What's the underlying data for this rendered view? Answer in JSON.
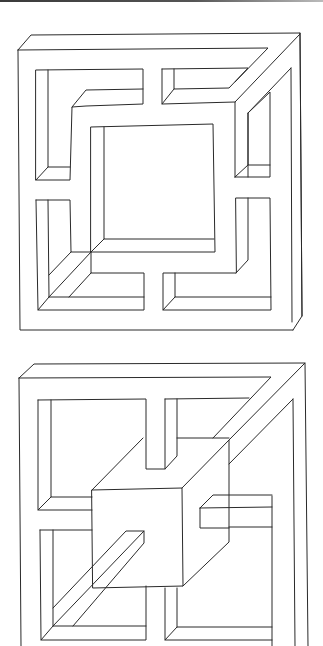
{
  "figure": {
    "panels": [
      {
        "name": "impossible-frame-maze",
        "label": "Impossible square frame with L-shaped inner channels"
      },
      {
        "name": "impossible-frame-cube",
        "label": "Impossible square frame with central cube and crossbars"
      }
    ],
    "colors": {
      "line": "#2a2a2a",
      "background": "#ffffff",
      "top_band": "#3a3a3a"
    }
  }
}
